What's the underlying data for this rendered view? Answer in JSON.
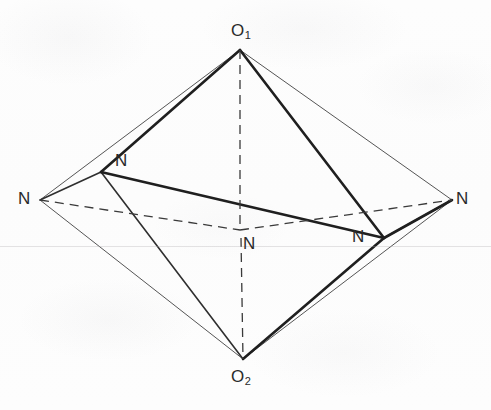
{
  "figure": {
    "width": 491,
    "height": 410,
    "background_color": "#fdfdfd",
    "line_color": "#2a2a2a",
    "thin_line_color": "#555555",
    "dashed_line_color": "#3a3a3a"
  },
  "labels": [
    {
      "id": "o1",
      "element": "O",
      "subscript": "1",
      "text": "O",
      "x": 231,
      "y": 22,
      "name": "label-o1-apex"
    },
    {
      "id": "o2",
      "element": "O",
      "subscript": "2",
      "text": "O",
      "x": 231,
      "y": 368,
      "name": "label-o2-apex"
    },
    {
      "id": "n-left",
      "element": "N",
      "subscript": "",
      "text": "N",
      "x": 18,
      "y": 190,
      "name": "label-n-left-outer"
    },
    {
      "id": "n-right",
      "element": "N",
      "subscript": "",
      "text": "N",
      "x": 456,
      "y": 190,
      "name": "label-n-right-outer"
    },
    {
      "id": "n-upper-inner",
      "element": "N",
      "subscript": "",
      "text": "N",
      "x": 115,
      "y": 152,
      "name": "label-n-upper-inner"
    },
    {
      "id": "n-lower-inner",
      "element": "N",
      "subscript": "",
      "text": "N",
      "x": 352,
      "y": 228,
      "name": "label-n-lower-inner"
    },
    {
      "id": "n-center",
      "element": "N",
      "subscript": "",
      "text": "N",
      "x": 243,
      "y": 235,
      "name": "label-n-center-rear"
    }
  ],
  "vertices": {
    "o1": {
      "x": 240,
      "y": 50,
      "label": "O1"
    },
    "o2": {
      "x": 243,
      "y": 359,
      "label": "O2"
    },
    "n_left": {
      "x": 40,
      "y": 200,
      "label": "N"
    },
    "n_right": {
      "x": 452,
      "y": 200,
      "label": "N"
    },
    "n_upper_inner": {
      "x": 101,
      "y": 172,
      "label": "N"
    },
    "n_lower_inner": {
      "x": 384,
      "y": 238,
      "label": "N"
    },
    "n_center": {
      "x": 240,
      "y": 228,
      "label": "N"
    }
  },
  "edges": {
    "bold": [
      {
        "from": "o1",
        "to": "n_upper_inner",
        "name": "edge-o1-n-upper"
      },
      {
        "from": "o1",
        "to": "n_lower_inner",
        "name": "edge-o1-n-lower"
      },
      {
        "from": "o2",
        "to": "n_lower_inner",
        "name": "edge-o2-n-lower"
      },
      {
        "from": "n_upper_inner",
        "to": "n_lower_inner",
        "name": "edge-equatorial-front"
      },
      {
        "from": "n_upper_inner",
        "to": "n_left",
        "name": "edge-n-upper-n-left"
      },
      {
        "from": "n_lower_inner",
        "to": "n_right",
        "name": "edge-n-lower-n-right"
      }
    ],
    "medium": [
      {
        "from": "n_upper_inner",
        "to": "o2",
        "name": "edge-n-upper-o2"
      },
      {
        "from": "n_lower_inner",
        "to": "n_right",
        "name": "edge-n-lower-right-lower"
      }
    ],
    "thin": [
      {
        "from": "o1",
        "to": "n_left",
        "name": "edge-o1-n-left"
      },
      {
        "from": "o1",
        "to": "n_right",
        "name": "edge-o1-n-right"
      },
      {
        "from": "o2",
        "to": "n_left",
        "name": "edge-o2-n-left"
      },
      {
        "from": "o2",
        "to": "n_right",
        "name": "edge-o2-n-right"
      }
    ],
    "dashed": [
      {
        "from": "o1",
        "to": "n_center",
        "name": "edge-o1-n-center-hidden"
      },
      {
        "from": "o2",
        "to": "n_center",
        "name": "edge-o2-n-center-hidden"
      },
      {
        "from": "n_left",
        "to": "n_center",
        "name": "edge-n-left-n-center-hidden"
      },
      {
        "from": "n_center",
        "to": "n_right",
        "name": "edge-n-center-n-right-hidden"
      }
    ]
  },
  "scan_line": {
    "y": 246
  }
}
